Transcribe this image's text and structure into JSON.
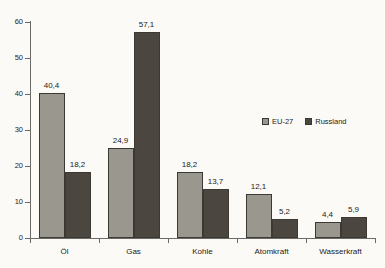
{
  "chart_data": {
    "type": "bar",
    "title": "",
    "subtitle": "",
    "xlabel": "",
    "ylabel": "",
    "categories": [
      "Öl",
      "Gas",
      "Kohle",
      "Atomkraft",
      "Wasserkraft"
    ],
    "series": [
      {
        "name": "EU-27",
        "color": "#9a988e",
        "values": [
          40.4,
          24.9,
          18.2,
          12.1,
          4.4
        ],
        "value_labels": [
          "40,4",
          "24,9",
          "18,2",
          "12,1",
          "4,4"
        ]
      },
      {
        "name": "Russland",
        "color": "#4b4640",
        "values": [
          18.2,
          57.1,
          13.7,
          5.2,
          5.9
        ],
        "value_labels": [
          "18,2",
          "57,1",
          "13,7",
          "5,2",
          "5,9"
        ]
      }
    ],
    "ylim": [
      0,
      60
    ],
    "yticks": [
      0,
      10,
      20,
      30,
      40,
      50,
      60
    ],
    "ytick_labels": [
      "0",
      "10",
      "20",
      "30",
      "40",
      "50",
      "60"
    ],
    "grid": false,
    "legend_position": "middle-right",
    "decimal_separator": ","
  },
  "legend": {
    "entries": [
      {
        "label": "EU-27",
        "swatch": "legend-swatch-eu27"
      },
      {
        "label": "Russland",
        "swatch": "legend-swatch-russland"
      }
    ]
  },
  "colors": {
    "background": "#fbfaf7",
    "axis": "#6b6a66",
    "text": "#1d1b17",
    "series_eu27": "#9a988e",
    "series_russland": "#4b4640"
  }
}
